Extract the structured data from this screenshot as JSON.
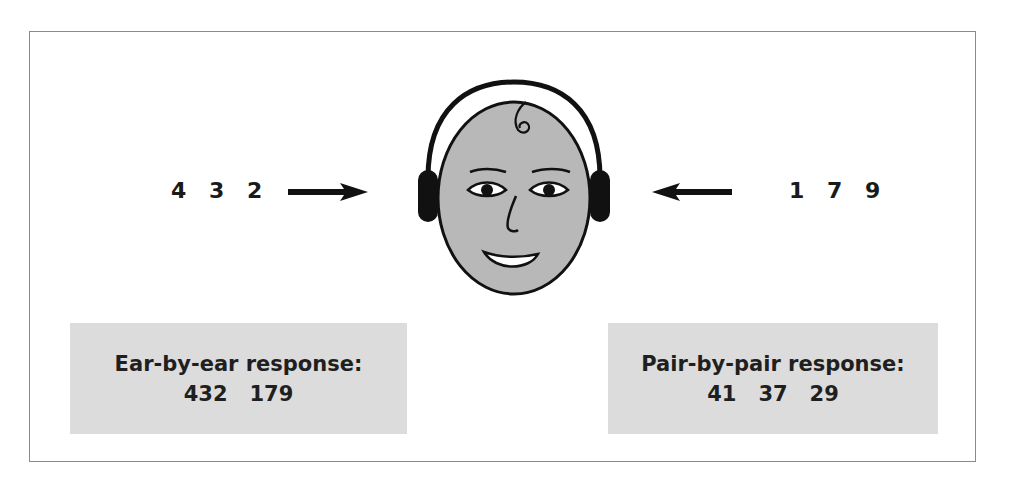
{
  "diagram": {
    "left_ear": {
      "digits": [
        "4",
        "3",
        "2"
      ],
      "arrow_direction": "right"
    },
    "right_ear": {
      "digits": [
        "1",
        "7",
        "9"
      ],
      "arrow_direction": "left"
    },
    "center_figure": "face-with-headphones-icon",
    "responses": {
      "ear_by_ear": {
        "title": "Ear-by-ear response:",
        "values": [
          "432",
          "179"
        ]
      },
      "pair_by_pair": {
        "title": "Pair-by-pair response:",
        "values": [
          "41",
          "37",
          "29"
        ]
      }
    },
    "colors": {
      "frame": "#8a8a8a",
      "face_fill": "#b8b8b8",
      "response_box": "#dcdcdc",
      "ink": "#111111"
    }
  }
}
